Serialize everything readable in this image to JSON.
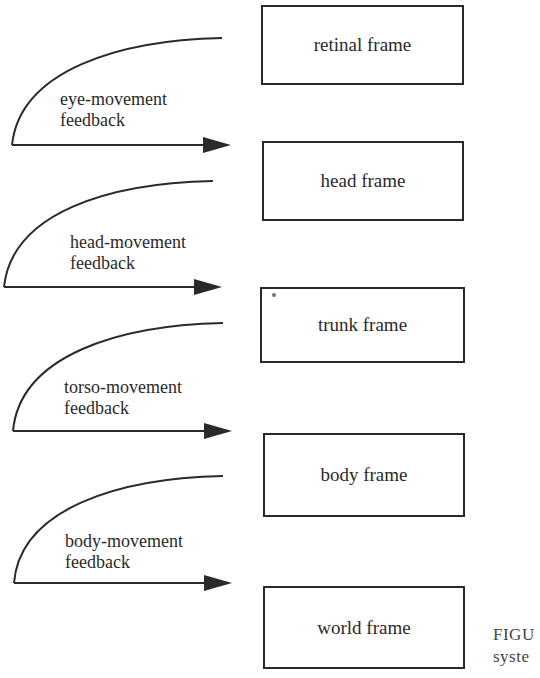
{
  "diagram": {
    "frames": [
      {
        "id": "retinal",
        "label": "retinal frame"
      },
      {
        "id": "head",
        "label": "head frame"
      },
      {
        "id": "trunk",
        "label": "trunk frame"
      },
      {
        "id": "body",
        "label": "body frame"
      },
      {
        "id": "world",
        "label": "world frame"
      }
    ],
    "feedback": [
      {
        "line1": "eye-movement",
        "line2": "feedback",
        "from": "retinal",
        "to": "head"
      },
      {
        "line1": "head-movement",
        "line2": "feedback",
        "from": "head",
        "to": "trunk"
      },
      {
        "line1": "torso-movement",
        "line2": "feedback",
        "from": "trunk",
        "to": "body"
      },
      {
        "line1": "body-movement",
        "line2": "feedback",
        "from": "body",
        "to": "world"
      }
    ],
    "caption": {
      "line1": "FIGU",
      "line2": "syste"
    },
    "colors": {
      "stroke": "#2a2a2a",
      "background": "#ffffff"
    }
  }
}
